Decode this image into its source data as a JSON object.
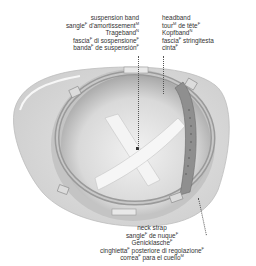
{
  "diagram": {
    "labels": {
      "suspension_band": [
        {
          "text": "suspension band",
          "gender": ""
        },
        {
          "text": "sangle d'amortissement",
          "gender": "M"
        },
        {
          "text": "Trageband",
          "gender": "N"
        },
        {
          "text": "fascia di sospensione",
          "gender": "F"
        },
        {
          "text": "banda de suspensión",
          "gender": "F"
        }
      ],
      "headband": [
        {
          "text": "headband",
          "gender": ""
        },
        {
          "text": "tour de tête",
          "gender": "M"
        },
        {
          "text": "Kopfband",
          "gender": "N"
        },
        {
          "text": "fascia stringitesta",
          "gender": "F"
        },
        {
          "text": "cinta",
          "gender": "F"
        }
      ],
      "neck_strap": [
        {
          "text": "neck strap",
          "gender": ""
        },
        {
          "text": "sangle de nuque",
          "gender": "F"
        },
        {
          "text": "Genicklasche",
          "gender": "F"
        },
        {
          "text": "cinghietta posteriore di regolazione",
          "gender": "F"
        },
        {
          "text": "correa para el cuello",
          "gender": "M"
        }
      ]
    },
    "center_mark": "fasteners"
  },
  "lines": {
    "sb": {
      "l0": "suspension band",
      "l1a": "sangle",
      "l1s": "F",
      "l1b": " d'amortissement",
      "l1s2": "M",
      "l2a": "Trageband",
      "l2s": "N",
      "l3a": "fascia",
      "l3s": "F",
      "l3b": " di sospensione",
      "l3s2": "F",
      "l4a": "banda",
      "l4s": "F",
      "l4b": " de suspensión",
      "l4s2": "F"
    },
    "hb": {
      "l0": "headband",
      "l1a": "tour",
      "l1s": "M",
      "l1b": " de tête",
      "l1s2": "F",
      "l2a": "Kopfband",
      "l2s": "N",
      "l3a": "fascia",
      "l3s": "F",
      "l3b": " stringitesta",
      "l4a": "cinta",
      "l4s": "F"
    },
    "ns": {
      "l0": "neck strap",
      "l1a": "sangle",
      "l1s": "F",
      "l1b": " de nuque",
      "l1s2": "F",
      "l2a": "Genicklasche",
      "l2s": "F",
      "l3a": "cinghietta",
      "l3s": "F",
      "l3b": " posteriore di regolazione",
      "l3s2": "F",
      "l4a": "correa",
      "l4s": "F",
      "l4b": " para el cuello",
      "l4s2": "M"
    }
  }
}
